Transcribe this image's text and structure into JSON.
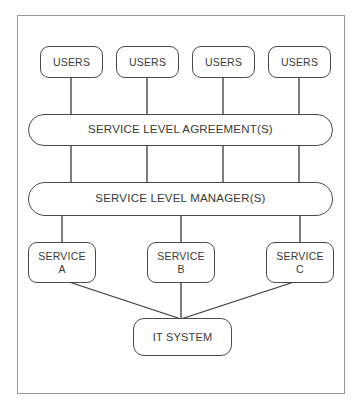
{
  "diagram": {
    "background_color": "#ffffff",
    "frame_color": "#9a9a9a",
    "node_border_color": "#4a4a4a",
    "node_fill_color": "#ffffff",
    "connector_color": "#3a3a3a",
    "users": [
      {
        "label": "USERS"
      },
      {
        "label": "USERS"
      },
      {
        "label": "USERS"
      },
      {
        "label": "USERS"
      }
    ],
    "sla": {
      "label": "SERVICE LEVEL AGREEMENT(S)"
    },
    "slm": {
      "label": "SERVICE LEVEL MANAGER(S)"
    },
    "services": [
      {
        "line1": "SERVICE",
        "line2": "A"
      },
      {
        "line1": "SERVICE",
        "line2": "B"
      },
      {
        "line1": "SERVICE",
        "line2": "C"
      }
    ],
    "system": {
      "label": "IT SYSTEM"
    }
  }
}
